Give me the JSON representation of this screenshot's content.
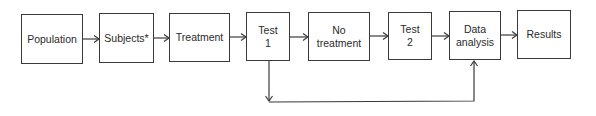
{
  "diagram": {
    "type": "flowchart",
    "nodes": [
      {
        "id": "population",
        "label": "Population"
      },
      {
        "id": "subjects",
        "label": "Subjects*"
      },
      {
        "id": "treatment",
        "label": "Treatment"
      },
      {
        "id": "test1",
        "label": "Test\n1"
      },
      {
        "id": "no_treatment",
        "label": "No\ntreatment"
      },
      {
        "id": "test2",
        "label": "Test\n2"
      },
      {
        "id": "data_analysis",
        "label": "Data\nanalysis"
      },
      {
        "id": "results",
        "label": "Results"
      }
    ],
    "edges": [
      {
        "from": "population",
        "to": "subjects"
      },
      {
        "from": "subjects",
        "to": "treatment"
      },
      {
        "from": "treatment",
        "to": "test1"
      },
      {
        "from": "test1",
        "to": "no_treatment"
      },
      {
        "from": "no_treatment",
        "to": "test2"
      },
      {
        "from": "test2",
        "to": "data_analysis"
      },
      {
        "from": "data_analysis",
        "to": "results"
      },
      {
        "from": "test1",
        "to": "data_analysis",
        "route": "below"
      }
    ],
    "colors": {
      "stroke": "#3a3a3a",
      "text": "#2a2a2a",
      "background": "#ffffff"
    }
  }
}
